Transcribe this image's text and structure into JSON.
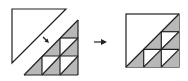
{
  "diagram": {
    "colors": {
      "background": "#ffffff",
      "stroke": "#222222",
      "shade": "#b8b8b8"
    },
    "left_figure": {
      "label": "before",
      "white_triangle": [
        [
          12,
          9
        ],
        [
          66,
          9
        ],
        [
          12,
          63
        ]
      ],
      "grid_triangle": {
        "apex_top": [
          78,
          20
        ],
        "bottom_left": [
          24,
          75
        ],
        "bottom_right": [
          78,
          75
        ],
        "rows": 3,
        "cols": 3
      },
      "motion_arrow": {
        "from": [
          43,
          37
        ],
        "to": [
          48,
          42
        ]
      }
    },
    "transition_arrow": {
      "from": [
        94,
        42
      ],
      "to": [
        106,
        42
      ]
    },
    "right_figure": {
      "label": "after",
      "square": {
        "x": 126,
        "y": 14,
        "size": 53
      },
      "rows": 3,
      "cols": 3
    }
  }
}
